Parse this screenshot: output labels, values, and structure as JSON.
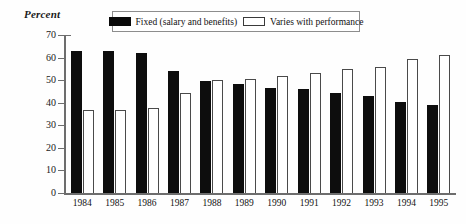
{
  "chart_data": {
    "type": "bar",
    "title": "",
    "ylabel": "Percent",
    "xlabel": "",
    "ylim": [
      0,
      70
    ],
    "yticks": [
      0,
      10,
      20,
      30,
      40,
      50,
      60,
      70
    ],
    "grid": false,
    "legend_position": "top-center",
    "categories": [
      "1984",
      "1985",
      "1986",
      "1987",
      "1988",
      "1989",
      "1990",
      "1991",
      "1992",
      "1993",
      "1994",
      "1995"
    ],
    "series": [
      {
        "name": "Fixed (salary and benefits)",
        "color": "#0d0d0d",
        "values": [
          63,
          63,
          62,
          54,
          49.5,
          48.5,
          46.5,
          46,
          44.5,
          43,
          40.5,
          39
        ]
      },
      {
        "name": "Varies with performance",
        "color": "#ffffff",
        "values": [
          37,
          37,
          37.5,
          44.5,
          50,
          50.5,
          52,
          53,
          55,
          56,
          59.5,
          61
        ]
      }
    ]
  },
  "legend": {
    "items": [
      {
        "label": "Fixed (salary and benefits)",
        "swatch": "black"
      },
      {
        "label": "Varies with performance",
        "swatch": "white"
      }
    ]
  },
  "axis": {
    "y_title": "Percent"
  }
}
